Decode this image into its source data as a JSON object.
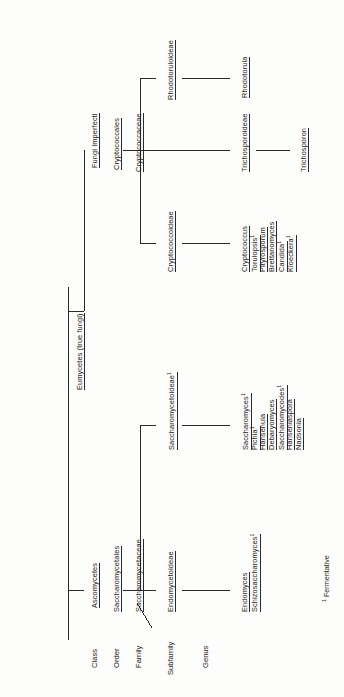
{
  "root": {
    "label": "Eumycetes (true fungi)"
  },
  "rank_labels": [
    {
      "key": "class",
      "label": "Class"
    },
    {
      "key": "order",
      "label": "Order"
    },
    {
      "key": "family",
      "label": "Family"
    },
    {
      "key": "subfamily",
      "label": "Subfamily"
    },
    {
      "key": "genus",
      "label": "Genus"
    }
  ],
  "branches": {
    "ascomycetes": {
      "class": "Ascomycetes",
      "order": "Saccharomycetales",
      "family": "Saccharomycetaceae",
      "subfamilies": [
        {
          "name": "Endomycetoideae",
          "genera": [
            {
              "name": "Endomyces",
              "fermentative": false
            },
            {
              "name": "Schizosaccharomyces",
              "fermentative": true
            }
          ]
        },
        {
          "name": "Saccharomycetoideae",
          "fermentative": true,
          "genera": [
            {
              "name": "Saccharomyces",
              "fermentative": true
            },
            {
              "name": "Pichia",
              "fermentative": true
            },
            {
              "name": "Hansenula",
              "fermentative": false
            },
            {
              "name": "Debaryomyces",
              "fermentative": false
            },
            {
              "name": "Saccharomycodes",
              "fermentative": true
            },
            {
              "name": "Hanseniaspora",
              "fermentative": false
            },
            {
              "name": "Nadsonia",
              "fermentative": false
            }
          ]
        }
      ]
    },
    "fungi_imperfecti": {
      "class": "Fungi Imperfecti",
      "order": "Cryptococcales",
      "family": "Cryptococcaceae",
      "subfamilies": [
        {
          "name": "Cryptococcoideae",
          "genera": [
            {
              "name": "Cryptococcus",
              "fermentative": false
            },
            {
              "name": "Torulopsis",
              "fermentative": true
            },
            {
              "name": "Pityrosporum",
              "fermentative": false
            },
            {
              "name": "Brettanomyces",
              "fermentative": false
            },
            {
              "name": "Candida",
              "fermentative": true
            },
            {
              "name": "Kloeckera",
              "fermentative": true
            }
          ]
        },
        {
          "name": "Trichosporoideae",
          "genera": [
            {
              "name": "Trichosporon",
              "fermentative": false
            }
          ]
        },
        {
          "name": "Rhodotoruloideae",
          "genera": [
            {
              "name": "Rhodotorula",
              "fermentative": false
            }
          ]
        }
      ]
    }
  },
  "footnote": {
    "marker": "1",
    "text": "Fermentative"
  },
  "colors": {
    "ink": "#1b1b1b",
    "rule": "#2a2a2a",
    "paper": "#fdfdfc"
  }
}
